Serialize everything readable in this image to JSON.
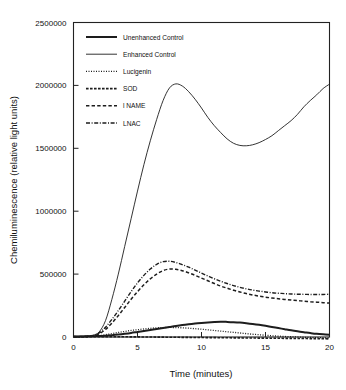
{
  "chart_data": {
    "type": "line",
    "title": "",
    "xlabel": "Time (minutes)",
    "ylabel": "Chemiluminescence (relative light units)",
    "xlim": [
      0,
      20
    ],
    "ylim": [
      0,
      2500000
    ],
    "xticks": [
      0,
      5,
      10,
      15,
      20
    ],
    "xtick_labels": [
      "0",
      "5",
      "10",
      "15",
      "20"
    ],
    "yticks": [
      0,
      500000,
      1000000,
      1500000,
      2000000,
      2500000
    ],
    "ytick_labels": [
      "0",
      "500000",
      "1000000",
      "1500000",
      "2000000",
      "2500000"
    ],
    "grid": false,
    "legend_position": "upper-left-inside",
    "x": [
      0,
      0.5,
      1,
      1.5,
      2,
      2.5,
      3,
      3.5,
      4,
      4.5,
      5,
      5.5,
      6,
      6.5,
      7,
      7.5,
      8,
      8.5,
      9,
      9.5,
      10,
      10.5,
      11,
      11.5,
      12,
      12.5,
      13,
      13.5,
      14,
      14.5,
      15,
      15.5,
      16,
      16.5,
      17,
      17.5,
      18,
      18.5,
      19,
      19.5,
      20
    ],
    "series": [
      {
        "name": "Unenhanced Control",
        "style": "solid-thick",
        "values": [
          4000,
          4000,
          5000,
          6000,
          8000,
          10000,
          14000,
          19000,
          25000,
          32000,
          40000,
          48000,
          56000,
          64000,
          72000,
          80000,
          88000,
          95000,
          101000,
          107000,
          112000,
          116000,
          119000,
          121000,
          120000,
          118000,
          115000,
          110000,
          104000,
          97000,
          89000,
          80000,
          71000,
          62000,
          53000,
          45000,
          38000,
          31000,
          25000,
          21000,
          18000
        ]
      },
      {
        "name": "Enhanced Control",
        "style": "solid-thin",
        "values": [
          6000,
          6000,
          8000,
          14000,
          40000,
          130000,
          300000,
          500000,
          720000,
          940000,
          1160000,
          1370000,
          1560000,
          1730000,
          1880000,
          1980000,
          2012000,
          1995000,
          1950000,
          1890000,
          1820000,
          1745000,
          1680000,
          1625000,
          1575000,
          1540000,
          1523000,
          1520000,
          1528000,
          1545000,
          1570000,
          1600000,
          1640000,
          1680000,
          1720000,
          1770000,
          1830000,
          1880000,
          1925000,
          1975000,
          2010000
        ]
      },
      {
        "name": "Lucigenin",
        "style": "dotted-fine",
        "values": [
          2000,
          2000,
          3000,
          5000,
          10000,
          18000,
          27000,
          36000,
          44000,
          52000,
          58000,
          64000,
          69000,
          73000,
          75000,
          76000,
          75000,
          73000,
          70000,
          66000,
          62000,
          57000,
          52000,
          47000,
          42000,
          37000,
          32000,
          27000,
          22000,
          18000,
          14000,
          10000,
          7000,
          4000,
          2000,
          0,
          -2000,
          -4000,
          -5000,
          -6000,
          -7000
        ]
      },
      {
        "name": "SOD",
        "style": "dashed-dense",
        "values": [
          1000,
          1000,
          1000,
          2000,
          3000,
          3000,
          3000,
          2000,
          2000,
          1000,
          1000,
          0,
          0,
          -1000,
          -1000,
          -2000,
          -2000,
          -3000,
          -3000,
          -4000,
          -4000,
          -5000,
          -5000,
          -6000,
          -6000,
          -7000,
          -7000,
          -8000,
          -8000,
          -9000,
          -9000,
          -10000,
          -10000,
          -11000,
          -11000,
          -12000,
          -12000,
          -13000,
          -13000,
          -14000,
          -15000
        ]
      },
      {
        "name": "l NAME",
        "style": "dashed-medium",
        "values": [
          3000,
          3000,
          4000,
          8000,
          25000,
          60000,
          110000,
          170000,
          235000,
          300000,
          360000,
          415000,
          462000,
          500000,
          528000,
          540000,
          538000,
          527000,
          510000,
          490000,
          468000,
          447000,
          425000,
          405000,
          388000,
          372000,
          358000,
          345000,
          334000,
          325000,
          317000,
          310000,
          304000,
          299000,
          294000,
          289000,
          285000,
          281000,
          277000,
          273000,
          270000
        ]
      },
      {
        "name": "LNAC",
        "style": "dashdot",
        "values": [
          3000,
          3000,
          5000,
          10000,
          32000,
          78000,
          140000,
          210000,
          285000,
          360000,
          430000,
          490000,
          540000,
          578000,
          599000,
          602000,
          592000,
          575000,
          555000,
          532000,
          508000,
          485000,
          463000,
          443000,
          425000,
          409000,
          395000,
          383000,
          373000,
          365000,
          358000,
          352000,
          348000,
          345000,
          342000,
          340000,
          339000,
          338000,
          338000,
          338000,
          340000
        ]
      }
    ]
  },
  "legend": {
    "items": [
      {
        "label": "Unenhanced Control"
      },
      {
        "label": "Enhanced Control"
      },
      {
        "label": "Lucigenin"
      },
      {
        "label": "SOD"
      },
      {
        "label": "l NAME"
      },
      {
        "label": "LNAC"
      }
    ]
  },
  "colors": {
    "line": "#1d1d1d",
    "axis": "#222222",
    "background": "#ffffff"
  }
}
